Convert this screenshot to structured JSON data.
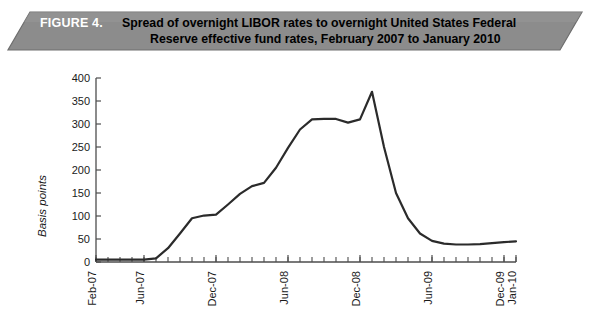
{
  "banner": {
    "figure_label": "FIGURE 4.",
    "title_line_1": "Spread of overnight LIBOR rates to overnight United States Federal",
    "title_line_2": "Reserve effective fund rates, February 2007 to January 2010",
    "fill_color": "#8c8c8c",
    "edge_color": "#6e6e6e",
    "label_color": "#ffffff",
    "title_color": "#000000"
  },
  "chart_data": {
    "type": "line",
    "title": "Spread of overnight LIBOR rates to overnight United States Federal Reserve effective fund rates, February 2007 to January 2010",
    "xlabel": "",
    "ylabel": "Basis points",
    "ylim": [
      0,
      400
    ],
    "yticks": [
      0,
      50,
      100,
      150,
      200,
      250,
      300,
      350,
      400
    ],
    "ytick_labels": [
      "0",
      "50",
      "100",
      "150",
      "200",
      "250",
      "300",
      "350",
      "400"
    ],
    "grid": false,
    "legend": "none",
    "line_color": "#2b2b2b",
    "line_width": 2.2,
    "axis_color": "#4d4d4d",
    "xtick_labels": [
      "Feb-07",
      "Jun-07",
      "Dec-07",
      "Jun-08",
      "Dec-08",
      "Jun-09",
      "Dec-09",
      "Jan-10"
    ],
    "xtick_label_rotation": 90,
    "xtick_label_months": [
      "Feb-07",
      "Jun-07",
      "Dec-07",
      "Jun-08",
      "Dec-08",
      "Jun-09",
      "Dec-09",
      "Jan-10"
    ],
    "x_range_months": [
      "Feb-07",
      "Jan-10"
    ],
    "x_minor_tick_interval_months": 1,
    "x": [
      "Feb-07",
      "Mar-07",
      "Apr-07",
      "May-07",
      "Jun-07",
      "Jul-07",
      "Aug-07",
      "Sep-07",
      "Oct-07",
      "Nov-07",
      "Dec-07",
      "Jan-08",
      "Feb-08",
      "Mar-08",
      "Apr-08",
      "May-08",
      "Jun-08",
      "Jul-08",
      "Aug-08",
      "Sep-08",
      "Oct-08",
      "Nov-08",
      "Dec-08",
      "Jan-09",
      "Feb-09",
      "Mar-09",
      "Apr-09",
      "May-09",
      "Jun-09",
      "Jul-09",
      "Aug-09",
      "Sep-09",
      "Oct-09",
      "Nov-09",
      "Dec-09",
      "Jan-10"
    ],
    "values": [
      5,
      5,
      5,
      5,
      5,
      8,
      30,
      62,
      95,
      101,
      103,
      125,
      148,
      165,
      172,
      205,
      248,
      288,
      310,
      311,
      311,
      303,
      310,
      370,
      250,
      150,
      95,
      62,
      46,
      40,
      38,
      38,
      39,
      41,
      43,
      45
    ],
    "annotations": [
      {
        "label": "peak",
        "x": "Jan-09",
        "y": 370
      },
      {
        "label": "plateau",
        "x": "Aug-08",
        "y": 310
      }
    ]
  }
}
